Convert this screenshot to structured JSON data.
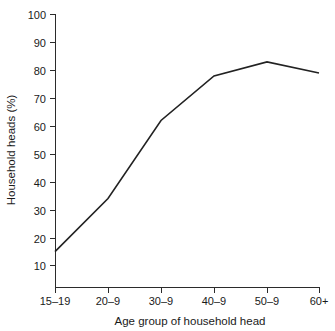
{
  "chart_data": {
    "type": "line",
    "title": "",
    "xlabel": "Age group of household head",
    "ylabel": "Household heads (%)",
    "categories": [
      "15–19",
      "20–9",
      "30–9",
      "40–9",
      "50–9",
      "60+"
    ],
    "values": [
      15,
      34,
      62,
      78,
      83,
      79
    ],
    "series": [
      {
        "name": "Household heads",
        "values": [
          15,
          34,
          62,
          78,
          83,
          79
        ]
      }
    ],
    "ylim": [
      0,
      100
    ],
    "yticks": [
      10,
      20,
      30,
      40,
      50,
      60,
      70,
      80,
      90,
      100
    ],
    "ytick_labels": [
      "10",
      "20",
      "30",
      "40",
      "50",
      "60",
      "70",
      "80",
      "90",
      "100"
    ],
    "xtick_labels": [
      "15–19",
      "20–9",
      "30–9",
      "40–9",
      "50–9",
      "60+"
    ],
    "grid": false,
    "legend": false,
    "legend_position": "none",
    "line_color": "#222222"
  },
  "axes": {
    "y_title": "Household heads (%)",
    "x_title": "Age group of household head"
  }
}
